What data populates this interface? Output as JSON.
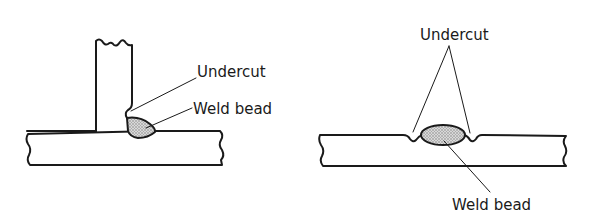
{
  "figure": {
    "left_panel": {
      "name": "Fillet weld on T-joint",
      "labels": {
        "undercut": "Undercut",
        "weld_bead": "Weld bead"
      }
    },
    "right_panel": {
      "name": "Butt weld on flat plate",
      "labels": {
        "undercut": "Undercut",
        "weld_bead": "Weld bead"
      }
    },
    "colors": {
      "line": "#1a1a1a",
      "bead_fill": "#bdbdbd",
      "background": "#ffffff"
    }
  }
}
